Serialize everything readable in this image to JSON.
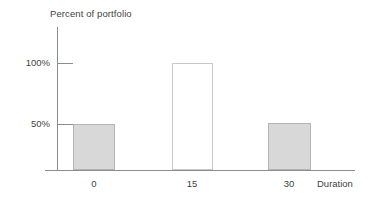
{
  "chart_data": {
    "type": "bar",
    "title": "Percent of portfolio",
    "xlabel": "Duration",
    "ylabel": "Percent of portfolio",
    "categories": [
      "0",
      "15",
      "30"
    ],
    "values": [
      50,
      100,
      51
    ],
    "series": [
      {
        "name": "Percent of portfolio",
        "values": [
          50,
          100,
          51
        ]
      }
    ],
    "ylim": [
      0,
      117
    ],
    "xlim": [
      null,
      null
    ],
    "ytick_labels": [
      "50%",
      "100%"
    ],
    "ytick_values": [
      50,
      100
    ],
    "xtick_labels": [
      "0",
      "15",
      "30"
    ],
    "grid": false,
    "legend": false,
    "legend_position": "none",
    "bar_styles": [
      {
        "category": "0",
        "fill": "#d8d8d8",
        "border": "#b4b4b4",
        "filled": true
      },
      {
        "category": "15",
        "fill": "#ffffff",
        "border": "#c9c9c9",
        "filled": false
      },
      {
        "category": "30",
        "fill": "#d8d8d8",
        "border": "#b4b4b4",
        "filled": true
      }
    ],
    "axis_color": "#8c8c8c",
    "text_color": "#3f3f3f"
  },
  "axes": {
    "title": "Percent of portfolio",
    "x_title": "Duration",
    "y_ticks": [
      {
        "label": "100%",
        "value": 100
      },
      {
        "label": "50%",
        "value": 50
      }
    ],
    "x_ticks": [
      {
        "label": "0",
        "value": 0
      },
      {
        "label": "15",
        "value": 15
      },
      {
        "label": "30",
        "value": 30
      }
    ]
  }
}
